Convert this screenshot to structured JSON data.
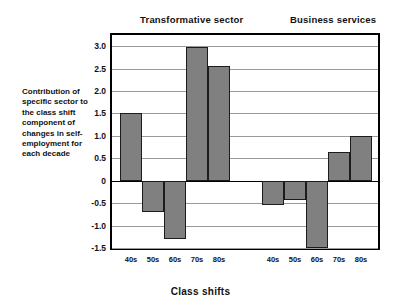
{
  "chart_data": {
    "type": "bar",
    "title": "",
    "xlabel": "Class shifts",
    "ylabel": "Contribution of specific sector to the class shift component of changes in self-employment for each decade",
    "ylim": [
      -1.5,
      3.25
    ],
    "yticks": [
      3.0,
      2.5,
      2.0,
      1.5,
      1.0,
      0.5,
      0,
      -0.5,
      -1.0,
      -1.5
    ],
    "ytick_labels": [
      "3.0",
      "2.5",
      "2.0",
      "1.5",
      "1.0",
      "0.5",
      "0",
      "-0.5",
      "-1.0",
      "-1.5"
    ],
    "grid": true,
    "legend_position": "none",
    "categories": [
      "40s",
      "50s",
      "60s",
      "70s",
      "80s"
    ],
    "groups": [
      {
        "name": "Transformative sector",
        "categories": [
          "40s",
          "50s",
          "60s",
          "70s",
          "80s"
        ],
        "values": [
          1.5,
          -0.7,
          -1.3,
          2.98,
          2.55
        ]
      },
      {
        "name": "Business services",
        "categories": [
          "40s",
          "50s",
          "60s",
          "70s",
          "80s"
        ],
        "values": [
          -0.55,
          -0.42,
          -1.5,
          0.63,
          1.0
        ]
      }
    ],
    "bar_color": "#808080",
    "bar_edge_color": "#1c1c1c",
    "gridline_color": "#9a9a9a",
    "axis_color": "#000000"
  },
  "titles": {
    "group_0": "Transformative sector",
    "group_1": "Business services"
  },
  "axes": {
    "y_caption": "Contribution of specific sector to the class shift component of changes in self-employment for each decade",
    "x_title": "Class shifts"
  }
}
